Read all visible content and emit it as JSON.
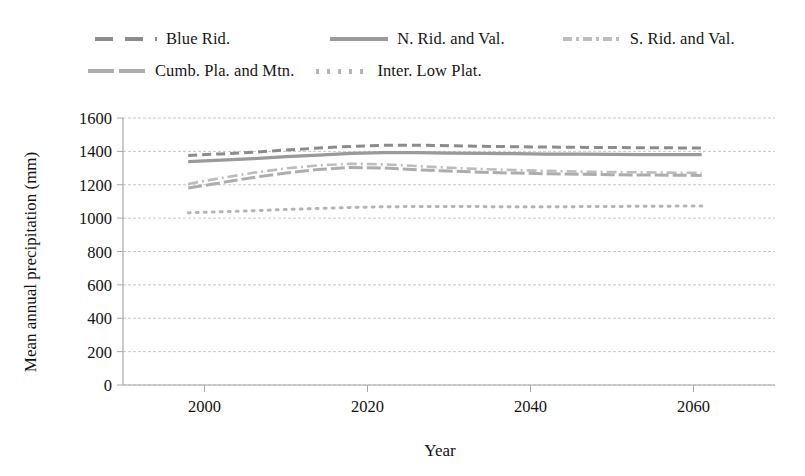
{
  "chart_data": {
    "type": "line",
    "title": "",
    "xlabel": "Year",
    "ylabel": "Mean annual precipitation (mm)",
    "xlim": [
      1990,
      2070
    ],
    "ylim": [
      0,
      1600
    ],
    "yticks": [
      0,
      200,
      400,
      600,
      800,
      1000,
      1200,
      1400,
      1600
    ],
    "xticks": [
      2000,
      2020,
      2040,
      2060
    ],
    "grid": "horizontal",
    "legend_position": "top",
    "x": [
      1998,
      2002,
      2006,
      2010,
      2014,
      2018,
      2022,
      2026,
      2030,
      2034,
      2038,
      2042,
      2046,
      2050,
      2054,
      2058,
      2061
    ],
    "series": [
      {
        "name": "Blue Rid.",
        "style": "dashed",
        "color": "#8c8c8c",
        "values": [
          1375,
          1385,
          1395,
          1408,
          1420,
          1430,
          1436,
          1437,
          1434,
          1430,
          1428,
          1426,
          1424,
          1423,
          1422,
          1421,
          1420
        ]
      },
      {
        "name": "N. Rid. and Val.",
        "style": "solid",
        "color": "#9a9a9a",
        "values": [
          1338,
          1348,
          1356,
          1368,
          1378,
          1388,
          1392,
          1392,
          1390,
          1388,
          1386,
          1384,
          1383,
          1382,
          1381,
          1380,
          1380
        ]
      },
      {
        "name": "S. Rid. and Val.",
        "style": "dashdot",
        "color": "#bdbdbd",
        "values": [
          1205,
          1240,
          1272,
          1298,
          1316,
          1326,
          1322,
          1312,
          1302,
          1294,
          1288,
          1283,
          1279,
          1276,
          1274,
          1272,
          1271
        ]
      },
      {
        "name": "Cumb. Pla. and Mtn.",
        "style": "longdash",
        "color": "#adadad",
        "values": [
          1180,
          1212,
          1244,
          1270,
          1292,
          1304,
          1300,
          1290,
          1282,
          1275,
          1270,
          1266,
          1263,
          1260,
          1258,
          1257,
          1256
        ]
      },
      {
        "name": "Inter. Low Plat.",
        "style": "dotted",
        "color": "#b5b5b5",
        "values": [
          1032,
          1038,
          1044,
          1052,
          1058,
          1064,
          1068,
          1070,
          1070,
          1069,
          1068,
          1068,
          1069,
          1070,
          1071,
          1072,
          1073
        ]
      }
    ]
  },
  "legend": {
    "items": [
      {
        "label": "Blue Rid.",
        "marker": "dashed"
      },
      {
        "label": "N. Rid. and Val.",
        "marker": "solid"
      },
      {
        "label": "S. Rid. and Val.",
        "marker": "dashdot"
      },
      {
        "label": "Cumb. Pla. and Mtn.",
        "marker": "longdash"
      },
      {
        "label": "Inter. Low Plat.",
        "marker": "dotted"
      }
    ]
  },
  "axes": {
    "y_title": "Mean annual precipitation (mm)",
    "x_title": "Year",
    "y_tick_labels": [
      "1600",
      "1400",
      "1200",
      "1000",
      "800",
      "600",
      "400",
      "200",
      "0"
    ],
    "x_tick_labels": [
      "2000",
      "2020",
      "2040",
      "2060"
    ]
  },
  "colors": {
    "grid": "#c9c9c9",
    "axis": "#a8a8a8",
    "text": "#111111"
  }
}
